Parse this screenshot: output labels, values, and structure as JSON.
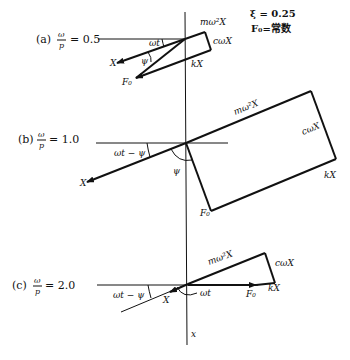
{
  "figure": {
    "parameters": {
      "zeta": "ξ = 0.25",
      "force": "F₀=常数"
    },
    "axis_label": "x",
    "panels": [
      {
        "id": "a",
        "case_label": "(a)",
        "ratio_num": "ω",
        "ratio_den": "p",
        "ratio_value": "= 0.5",
        "labels": {
          "m_omega2_X": "mω²X",
          "c_omega_X": "cωX",
          "kX": "kX",
          "X": "X",
          "F0": "F₀",
          "omega_t": "ωt",
          "psi": "ψ"
        }
      },
      {
        "id": "b",
        "case_label": "(b)",
        "ratio_num": "ω",
        "ratio_den": "p",
        "ratio_value": "= 1.0",
        "labels": {
          "m_omega2_X": "mω²X",
          "c_omega_X": "cωX",
          "kX": "kX",
          "X": "X",
          "F0": "F₀",
          "omega_t_minus_psi": "ωt − ψ",
          "psi": "ψ"
        }
      },
      {
        "id": "c",
        "case_label": "(c)",
        "ratio_num": "ω",
        "ratio_den": "p",
        "ratio_value": "= 2.0",
        "labels": {
          "m_omega2_X": "mω²X",
          "c_omega_X": "cωX",
          "kX": "kX",
          "X": "X",
          "F0": "F₀",
          "omega_t_minus_psi": "ωt − ψ",
          "omega_t": "ωt"
        }
      }
    ]
  }
}
